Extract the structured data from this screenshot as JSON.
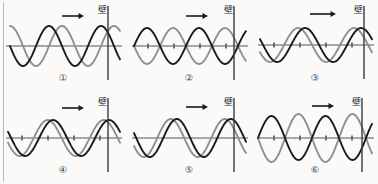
{
  "figure": {
    "background_color": "#fbfaf8",
    "incident_wave_color": "#8f8f8f",
    "reflected_wave_color": "#1a1a1a",
    "axis_color": "#555555",
    "wall_color": "#3a3a3a",
    "arrow_label": "direction-of-travel-arrow",
    "wall_label": "壁"
  },
  "panels": [
    {
      "id": "panel-1",
      "number": "①",
      "wall_label": "壁",
      "has_ticks": false,
      "axis_y": 46,
      "wall_x": 108,
      "arrow": {
        "x1": 62,
        "x2": 84,
        "y": 16
      },
      "gray_wave": {
        "amplitude": 20,
        "wavelength": 52,
        "phase_deg": 90,
        "start_x": 10,
        "end_x": 120
      },
      "black_wave": {
        "amplitude": 20,
        "wavelength": 52,
        "phase_deg": 180,
        "start_x": 10,
        "end_x": 120
      }
    },
    {
      "id": "panel-2",
      "number": "②",
      "wall_label": "壁",
      "has_ticks": true,
      "axis_y": 46,
      "wall_x": 108,
      "arrow": {
        "x1": 60,
        "x2": 82,
        "y": 16
      },
      "gray_wave": {
        "amplitude": 18,
        "wavelength": 52,
        "phase_deg": 180,
        "start_x": 8,
        "end_x": 120
      },
      "black_wave": {
        "amplitude": 18,
        "wavelength": 52,
        "phase_deg": 0,
        "start_x": 8,
        "end_x": 120
      }
    },
    {
      "id": "panel-3",
      "number": "③",
      "wall_label": "壁",
      "has_ticks": true,
      "axis_y": 45,
      "wall_x": 112,
      "arrow": {
        "x1": 58,
        "x2": 84,
        "y": 14
      },
      "gray_wave": {
        "amplitude": 17,
        "wavelength": 56,
        "phase_deg": 205,
        "start_x": 8,
        "end_x": 120
      },
      "black_wave": {
        "amplitude": 17,
        "wavelength": 56,
        "phase_deg": 160,
        "start_x": 8,
        "end_x": 120
      }
    },
    {
      "id": "panel-4",
      "number": "④",
      "wall_label": "壁",
      "has_ticks": true,
      "axis_y": 46,
      "wall_x": 108,
      "arrow": {
        "x1": 62,
        "x2": 84,
        "y": 16
      },
      "gray_wave": {
        "amplitude": 18,
        "wavelength": 56,
        "phase_deg": 195,
        "start_x": 8,
        "end_x": 120
      },
      "black_wave": {
        "amplitude": 18,
        "wavelength": 56,
        "phase_deg": 160,
        "start_x": 8,
        "end_x": 120
      }
    },
    {
      "id": "panel-5",
      "number": "⑤",
      "wall_label": "壁",
      "has_ticks": false,
      "axis_y": 46,
      "wall_x": 108,
      "arrow": {
        "x1": 60,
        "x2": 82,
        "y": 15
      },
      "gray_wave": {
        "amplitude": 19,
        "wavelength": 54,
        "phase_deg": 205,
        "start_x": 8,
        "end_x": 120
      },
      "black_wave": {
        "amplitude": 19,
        "wavelength": 54,
        "phase_deg": 165,
        "start_x": 8,
        "end_x": 120
      }
    },
    {
      "id": "panel-6",
      "number": "⑥",
      "wall_label": "壁",
      "has_ticks": true,
      "axis_y": 46,
      "wall_x": 110,
      "arrow": {
        "x1": 60,
        "x2": 82,
        "y": 14
      },
      "gray_wave": {
        "amplitude": 24,
        "wavelength": 54,
        "phase_deg": 180,
        "start_x": 6,
        "end_x": 120
      },
      "black_wave": {
        "amplitude": 22,
        "wavelength": 54,
        "phase_deg": 0,
        "start_x": 6,
        "end_x": 120
      }
    }
  ],
  "chart_data": {
    "type": "line",
    "xlabel": "",
    "ylabel": "",
    "legend_position": "none",
    "grid": false,
    "series": [
      {
        "name": "panel-1-gray",
        "amplitude": 20,
        "wavelength": 52,
        "phase_deg": 90
      },
      {
        "name": "panel-1-black",
        "amplitude": 20,
        "wavelength": 52,
        "phase_deg": 180
      },
      {
        "name": "panel-2-gray",
        "amplitude": 18,
        "wavelength": 52,
        "phase_deg": 180
      },
      {
        "name": "panel-2-black",
        "amplitude": 18,
        "wavelength": 52,
        "phase_deg": 0
      },
      {
        "name": "panel-3-gray",
        "amplitude": 17,
        "wavelength": 56,
        "phase_deg": 205
      },
      {
        "name": "panel-3-black",
        "amplitude": 17,
        "wavelength": 56,
        "phase_deg": 160
      },
      {
        "name": "panel-4-gray",
        "amplitude": 18,
        "wavelength": 56,
        "phase_deg": 195
      },
      {
        "name": "panel-4-black",
        "amplitude": 18,
        "wavelength": 56,
        "phase_deg": 160
      },
      {
        "name": "panel-5-gray",
        "amplitude": 19,
        "wavelength": 54,
        "phase_deg": 205
      },
      {
        "name": "panel-5-black",
        "amplitude": 19,
        "wavelength": 54,
        "phase_deg": 165
      },
      {
        "name": "panel-6-gray",
        "amplitude": 24,
        "wavelength": 54,
        "phase_deg": 180
      },
      {
        "name": "panel-6-black",
        "amplitude": 22,
        "wavelength": 54,
        "phase_deg": 0
      }
    ]
  }
}
